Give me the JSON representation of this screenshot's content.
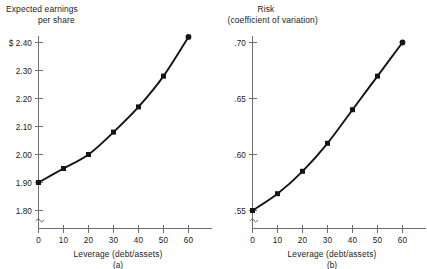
{
  "figure": {
    "panels": [
      {
        "id": "a",
        "caption": "(a)",
        "y_title_line1": "Expected earnings",
        "y_title_line2": "per share",
        "x_label": "Leverage (debt/assets)"
      },
      {
        "id": "b",
        "caption": "(b)",
        "y_title_line1": "Risk",
        "y_title_line2": "(coefficient of variation)",
        "x_label": "Leverage (debt/assets)"
      }
    ]
  },
  "chart_data": [
    {
      "type": "line",
      "title": "Expected earnings per share",
      "xlabel": "Leverage (debt/assets)",
      "ylabel": "Expected earnings per share",
      "caption": "(a)",
      "x": [
        0,
        10,
        20,
        30,
        40,
        50,
        60
      ],
      "values": [
        1.9,
        1.95,
        2.0,
        2.08,
        2.17,
        2.28,
        2.42
      ],
      "xticklabels": [
        "0",
        "10",
        "20",
        "30",
        "40",
        "50",
        "60"
      ],
      "yticklabels": [
        "1.80",
        "1.90",
        "2.00",
        "2.10",
        "2.20",
        "2.30",
        "$ 2.40"
      ],
      "ytickvalues": [
        1.8,
        1.9,
        2.0,
        2.1,
        2.2,
        2.3,
        2.4
      ],
      "xlim": [
        0,
        70
      ],
      "ylim": [
        1.8,
        2.4
      ],
      "axis_break": true,
      "grid": false,
      "legend": "none",
      "markers": "filled-square",
      "line_color": "#141414"
    },
    {
      "type": "line",
      "title": "Risk (coefficient of variation)",
      "xlabel": "Leverage (debt/assets)",
      "ylabel": "Risk (coefficient of variation)",
      "caption": "(b)",
      "x": [
        0,
        10,
        20,
        30,
        40,
        50,
        60
      ],
      "values": [
        0.55,
        0.565,
        0.585,
        0.61,
        0.64,
        0.67,
        0.7
      ],
      "xticklabels": [
        "0",
        "10",
        "20",
        "30",
        "40",
        "50",
        "60"
      ],
      "yticklabels": [
        ".55",
        ".60",
        ".65",
        ".70"
      ],
      "ytickvalues": [
        0.55,
        0.6,
        0.65,
        0.7
      ],
      "xlim": [
        0,
        70
      ],
      "ylim": [
        0.55,
        0.7
      ],
      "axis_break": true,
      "grid": false,
      "legend": "none",
      "markers": "filled-square",
      "line_color": "#141414"
    }
  ]
}
